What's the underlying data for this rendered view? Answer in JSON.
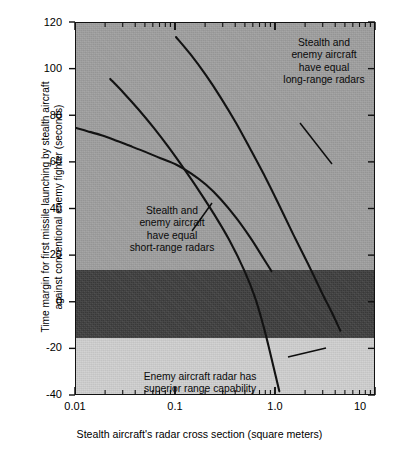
{
  "chart_data": {
    "type": "line",
    "title": "",
    "xlabel": "Stealth aircraft's radar cross section (square meters)",
    "ylabel_line1": "Time margin for first missile launching by stealth aircraft",
    "ylabel_line2": "against conventional enemy fighter (seconds)",
    "xscale": "log",
    "xlim": [
      0.01,
      10
    ],
    "ylim": [
      -40,
      120
    ],
    "xticks": [
      0.01,
      0.1,
      1.0,
      10
    ],
    "xtick_labels": [
      "0.01",
      "0.1",
      "1.0",
      "10"
    ],
    "yticks": [
      -40,
      -20,
      0,
      20,
      40,
      60,
      80,
      100,
      120
    ],
    "ytick_labels": [
      "-40",
      "-20",
      "0",
      "20",
      "40",
      "60",
      "80",
      "100",
      "120"
    ],
    "grid": false,
    "legend": "none",
    "bands": [
      {
        "name": "stealth-advantage-band",
        "y_from": 14,
        "y_to": 120,
        "color": "#9e9e9e"
      },
      {
        "name": "parity-band",
        "y_from": -15,
        "y_to": 14,
        "color": "#3d3d3d"
      },
      {
        "name": "enemy-advantage-band",
        "y_from": -40,
        "y_to": -15,
        "color": "#cfcfcf"
      }
    ],
    "series": [
      {
        "name": "Stealth and enemy aircraft have equal short-range radars",
        "points": [
          [
            0.01,
            75.0
          ],
          [
            0.013,
            73.6
          ],
          [
            0.018,
            71.8
          ],
          [
            0.025,
            69.6
          ],
          [
            0.035,
            67.2
          ],
          [
            0.05,
            64.6
          ],
          [
            0.07,
            62.0
          ],
          [
            0.1,
            59.3
          ],
          [
            0.14,
            55.6
          ],
          [
            0.2,
            50.6
          ],
          [
            0.28,
            44.4
          ],
          [
            0.4,
            36.4
          ],
          [
            0.56,
            27.6
          ],
          [
            0.75,
            19.0
          ],
          [
            0.9,
            13.6
          ]
        ]
      },
      {
        "name": "Stealth and enemy aircraft have equal mid-range radars",
        "points": [
          [
            0.022,
            96.0
          ],
          [
            0.03,
            90.0
          ],
          [
            0.042,
            83.0
          ],
          [
            0.06,
            75.0
          ],
          [
            0.085,
            66.5
          ],
          [
            0.12,
            57.5
          ],
          [
            0.17,
            48.0
          ],
          [
            0.24,
            38.0
          ],
          [
            0.34,
            27.0
          ],
          [
            0.48,
            14.0
          ],
          [
            0.62,
            2.0
          ],
          [
            0.76,
            -11.0
          ],
          [
            0.88,
            -22.0
          ],
          [
            1.0,
            -32.0
          ],
          [
            1.08,
            -38.0
          ]
        ]
      },
      {
        "name": "Stealth and enemy aircraft have equal long-range radars",
        "points": [
          [
            0.1,
            114.0
          ],
          [
            0.14,
            106.5
          ],
          [
            0.2,
            97.5
          ],
          [
            0.28,
            88.0
          ],
          [
            0.4,
            77.0
          ],
          [
            0.56,
            65.5
          ],
          [
            0.8,
            53.0
          ],
          [
            1.1,
            41.0
          ],
          [
            1.5,
            29.0
          ],
          [
            2.1,
            16.5
          ],
          [
            2.9,
            4.0
          ],
          [
            3.6,
            -4.0
          ],
          [
            4.4,
            -12.0
          ]
        ]
      }
    ],
    "annotations": [
      {
        "name": "long-range-annotation",
        "lines": [
          "Stealth and",
          "enemy aircraft",
          "have equal",
          "long-range radars"
        ],
        "leader_from": [
          224,
          100
        ],
        "leader_to": [
          256,
          141
        ]
      },
      {
        "name": "short-range-annotation",
        "lines": [
          "Stealth and",
          "enemy aircraft",
          "have equal",
          "short-range radars"
        ],
        "leader_from": [
          136,
          180
        ],
        "leader_to": [
          116,
          208
        ]
      },
      {
        "name": "enemy-advantage-annotation",
        "lines": [
          "Enemy aircraft radar has",
          "superior range capability"
        ],
        "leader_from": [
          212,
          356
        ],
        "leader_to": [
          250,
          347
        ]
      }
    ]
  },
  "axes": {
    "x_title": "Stealth aircraft's radar cross section (square meters)",
    "y_title_line1": "Time margin for first missile launching by stealth aircraft",
    "y_title_line2": "against conventional enemy fighter (seconds)",
    "y_labels": {
      "t120": "120",
      "t100": "100",
      "t80": "80",
      "t60": "60",
      "t40": "40",
      "t20": "20",
      "t0": "0",
      "tm20": "-20",
      "tm40": "-40"
    },
    "x_labels": {
      "x001": "0.01",
      "x01": "0.1",
      "x10": "1.0",
      "x100": "10"
    }
  },
  "annotation_text": {
    "long": {
      "l1": "Stealth and",
      "l2": "enemy aircraft",
      "l3": "have equal",
      "l4": "long-range radars"
    },
    "short": {
      "l1": "Stealth and",
      "l2": "enemy aircraft",
      "l3": "have equal",
      "l4": "short-range radars"
    },
    "enemy": {
      "l1": "Enemy aircraft radar has",
      "l2": "superior range capability"
    }
  },
  "colors": {
    "band_top": "#9e9e9e",
    "band_mid": "#3d3d3d",
    "band_bottom": "#cfcfcf",
    "curve": "#121212",
    "axis": "#111111",
    "text": "#000000",
    "background": "#ffffff"
  }
}
